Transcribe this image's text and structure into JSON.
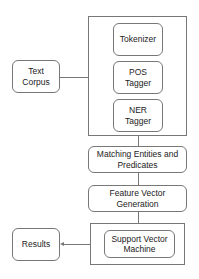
{
  "diagram": {
    "type": "flowchart",
    "nodes": {
      "text_corpus": "Text Corpus",
      "tokenizer": "Tokenizer",
      "pos_tagger": "POS Tagger",
      "ner_tagger": "NER Tagger",
      "matching": "Matching Entities and Predicates",
      "feature_vector": "Feature Vector Generation",
      "svm": "Support Vector Machine",
      "results": "Results"
    },
    "edges": [
      {
        "from": "text_corpus",
        "to": "preprocessing_group"
      },
      {
        "from": "preprocessing_group",
        "to": "matching"
      },
      {
        "from": "matching",
        "to": "feature_vector"
      },
      {
        "from": "feature_vector",
        "to": "svm_group"
      },
      {
        "from": "svm_group",
        "to": "results"
      }
    ],
    "groups": {
      "preprocessing_group": [
        "tokenizer",
        "pos_tagger",
        "ner_tagger"
      ],
      "svm_group": [
        "svm"
      ]
    },
    "colors": {
      "stroke": "#777777",
      "fill": "#ffffff",
      "text": "#222222"
    }
  }
}
